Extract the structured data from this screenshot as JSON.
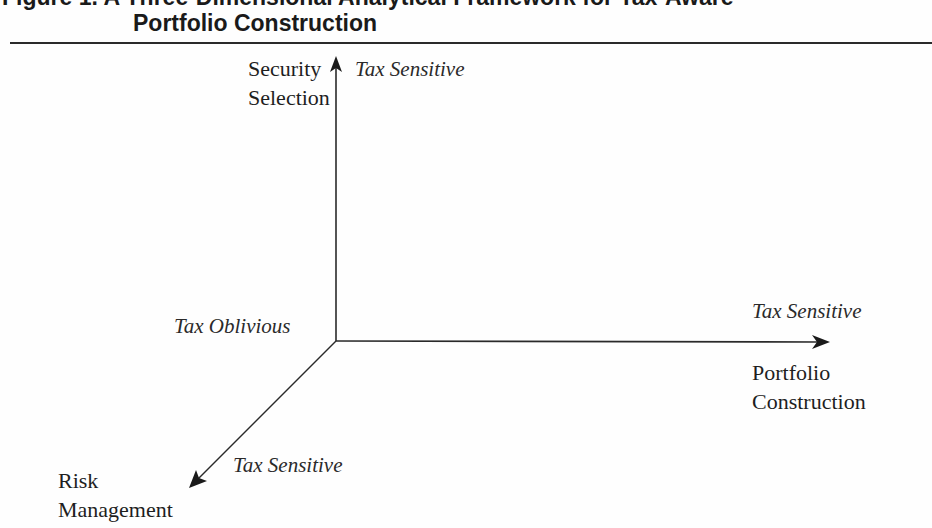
{
  "figure": {
    "title_line1": "Figure 1. A Three-Dimensional Analytical Framework for Tax-Aware",
    "title_line2": "Portfolio Construction"
  },
  "diagram": {
    "origin_label": "Tax Oblivious",
    "axes": [
      {
        "id": "vertical",
        "name_line1": "Security",
        "name_line2": "Selection",
        "end_label": "Tax Sensitive",
        "direction": "up"
      },
      {
        "id": "horizontal",
        "name_line1": "Portfolio",
        "name_line2": "Construction",
        "end_label": "Tax Sensitive",
        "direction": "right"
      },
      {
        "id": "diagonal",
        "name_line1": "Risk",
        "name_line2": "Management",
        "end_label": "Tax Sensitive",
        "direction": "down-left"
      }
    ],
    "colors": {
      "line": "#2a2a2a",
      "text": "#222222",
      "background": "#fefefe"
    }
  }
}
